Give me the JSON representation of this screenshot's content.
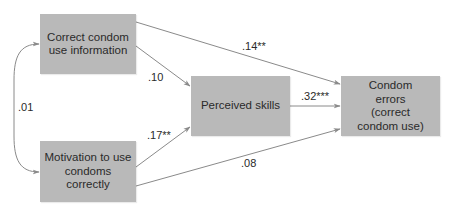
{
  "diagram": {
    "type": "path-model",
    "colors": {
      "node_fill": "#b9b9b9",
      "edge": "#8a8a8a",
      "text": "#2a2a2a",
      "background": "#ffffff"
    },
    "nodes": {
      "information": {
        "label": "Correct condom use information"
      },
      "motivation": {
        "label": "Motivation to use condoms correctly"
      },
      "skills": {
        "label": "Perceived skills"
      },
      "errors": {
        "label": "Condom errors (correct condom use)"
      }
    },
    "edges": {
      "information_errors": {
        "from": "information",
        "to": "errors",
        "coefficient": ".14**"
      },
      "information_skills": {
        "from": "information",
        "to": "skills",
        "coefficient": ".10"
      },
      "motivation_skills": {
        "from": "motivation",
        "to": "skills",
        "coefficient": ".17**"
      },
      "motivation_errors": {
        "from": "motivation",
        "to": "errors",
        "coefficient": ".08"
      },
      "skills_errors": {
        "from": "skills",
        "to": "errors",
        "coefficient": ".32***"
      },
      "information_motivation_correlation": {
        "from": "information",
        "to": "motivation",
        "coefficient": ".01",
        "bidirectional": true
      }
    }
  }
}
